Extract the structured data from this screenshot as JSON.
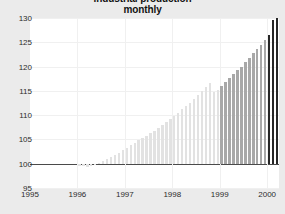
{
  "chart_data": {
    "type": "bar",
    "title": "industrial production",
    "subtitle": "monthly",
    "annotation": "(1995 = 100)",
    "xlabel": "",
    "ylabel": "",
    "ylim": [
      95,
      130
    ],
    "yticks": [
      95,
      100,
      105,
      110,
      115,
      120,
      125,
      130
    ],
    "xticks": [
      "1995",
      "1996",
      "1997",
      "1998",
      "1999",
      "2000"
    ],
    "xlim": [
      1995.0,
      2000.25
    ],
    "grid": true,
    "legend": false,
    "baseline": 100,
    "colors": {
      "bar_light": "#e2e2e2",
      "bar_medium": "#a8a8a8",
      "bar_dark": "#262626",
      "background": "#ebebeb",
      "plot_background": "#ffffff",
      "gridline": "#f0f0f0",
      "baseline_line": "#4a4a4a",
      "text": "#1a1a1a"
    },
    "series": [
      {
        "name": "industrial production index",
        "x": [
          1995.0,
          1995.083,
          1995.167,
          1995.25,
          1995.333,
          1995.417,
          1995.5,
          1995.583,
          1995.667,
          1995.75,
          1995.833,
          1995.917,
          1996.0,
          1996.083,
          1996.167,
          1996.25,
          1996.333,
          1996.417,
          1996.5,
          1996.583,
          1996.667,
          1996.75,
          1996.833,
          1996.917,
          1997.0,
          1997.083,
          1997.167,
          1997.25,
          1997.333,
          1997.417,
          1997.5,
          1997.583,
          1997.667,
          1997.75,
          1997.833,
          1997.917,
          1998.0,
          1998.083,
          1998.167,
          1998.25,
          1998.333,
          1998.417,
          1998.5,
          1998.583,
          1998.667,
          1998.75,
          1998.833,
          1998.917,
          1999.0,
          1999.083,
          1999.167,
          1999.25,
          1999.333,
          1999.417,
          1999.5,
          1999.583,
          1999.667,
          1999.75,
          1999.833,
          1999.917,
          2000.0,
          2000.083,
          2000.167
        ],
        "values": [
          100.0,
          100.0,
          100.0,
          100.0,
          100.0,
          100.0,
          100.0,
          100.0,
          100.0,
          100.0,
          100.0,
          100.0,
          99.6,
          99.5,
          99.4,
          99.6,
          99.8,
          100.2,
          100.6,
          101.0,
          101.4,
          101.8,
          102.3,
          102.8,
          103.3,
          103.8,
          104.3,
          104.8,
          105.3,
          105.8,
          106.3,
          106.8,
          107.4,
          108.0,
          108.6,
          109.2,
          109.8,
          110.5,
          111.2,
          111.9,
          112.6,
          113.4,
          114.2,
          115.0,
          115.8,
          116.6,
          114.8,
          115.2,
          115.9,
          116.8,
          117.6,
          118.4,
          119.2,
          120.0,
          120.9,
          121.8,
          122.7,
          123.6,
          124.5,
          125.4,
          126.4,
          129.5,
          129.9
        ],
        "shades": [
          "light",
          "light",
          "light",
          "light",
          "light",
          "light",
          "light",
          "light",
          "light",
          "light",
          "light",
          "light",
          "light",
          "light",
          "light",
          "light",
          "light",
          "light",
          "light",
          "light",
          "light",
          "light",
          "light",
          "light",
          "light",
          "light",
          "light",
          "light",
          "light",
          "light",
          "light",
          "light",
          "light",
          "light",
          "light",
          "light",
          "light",
          "light",
          "light",
          "light",
          "light",
          "light",
          "light",
          "light",
          "light",
          "light",
          "light",
          "light",
          "medium",
          "medium",
          "medium",
          "medium",
          "medium",
          "medium",
          "medium",
          "medium",
          "medium",
          "medium",
          "medium",
          "medium",
          "dark",
          "dark",
          "dark"
        ]
      }
    ]
  }
}
